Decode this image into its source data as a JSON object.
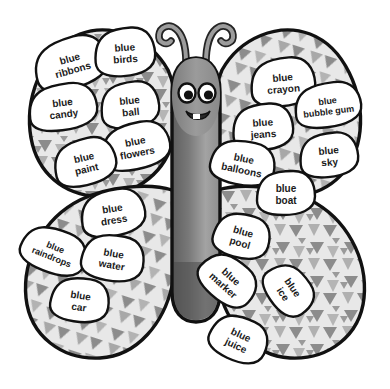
{
  "image": {
    "title": "Blue Words Butterfly",
    "subject": "butterfly-worksheet",
    "background_color": "#ffffff"
  },
  "colors": {
    "outline": "#111111",
    "wing_base": "#e8e8e8",
    "wing_triangle": "#8c8c8c",
    "wing_triangle_light": "#b5b5b5",
    "body_dark": "#6e6e6e",
    "body_light": "#a9a9a9",
    "antenna": "#8a8a8a",
    "eye_white": "#ffffff",
    "eye_pupil": "#111111",
    "mouth": "#2a2a2a",
    "tooth": "#ffffff",
    "label_fill": "#ffffff",
    "label_text": "#1a1a1a"
  },
  "body": {
    "name": "butterfly-body",
    "face": {
      "left_eye": "left-eye",
      "right_eye": "right-eye",
      "mouth": "smiling-mouth",
      "tooth": "tooth"
    },
    "antennae": [
      "left-antenna",
      "right-antenna"
    ]
  },
  "wings": [
    {
      "id": "upper-left",
      "label": "Upper Left Wing"
    },
    {
      "id": "upper-right",
      "label": "Upper Right Wing"
    },
    {
      "id": "lower-left",
      "label": "Lower Left Wing"
    },
    {
      "id": "lower-right",
      "label": "Lower Right Wing"
    }
  ],
  "word_labels": [
    {
      "id": "blue-ribbons",
      "line1": "blue",
      "line2": "ribbons",
      "wing": "upper-left",
      "x": 71,
      "y": 63,
      "rot": -16,
      "rx": 37,
      "ry": 25,
      "fs": 10
    },
    {
      "id": "blue-birds",
      "line1": "blue",
      "line2": "birds",
      "wing": "upper-left",
      "x": 125,
      "y": 52,
      "rot": -4,
      "rx": 30,
      "ry": 24,
      "fs": 10
    },
    {
      "id": "blue-candy",
      "line1": "blue",
      "line2": "candy",
      "wing": "upper-left",
      "x": 63,
      "y": 107,
      "rot": -7,
      "rx": 34,
      "ry": 23,
      "fs": 10
    },
    {
      "id": "blue-ball",
      "line1": "blue",
      "line2": "ball",
      "wing": "upper-left",
      "x": 130,
      "y": 105,
      "rot": -6,
      "rx": 29,
      "ry": 23,
      "fs": 10
    },
    {
      "id": "blue-flowers",
      "line1": "blue",
      "line2": "flowers",
      "wing": "upper-left",
      "x": 136,
      "y": 146,
      "rot": -11,
      "rx": 34,
      "ry": 23,
      "fs": 10
    },
    {
      "id": "blue-paint",
      "line1": "blue",
      "line2": "paint",
      "wing": "upper-left",
      "x": 85,
      "y": 162,
      "rot": -13,
      "rx": 31,
      "ry": 23,
      "fs": 10
    },
    {
      "id": "blue-crayon",
      "line1": "blue",
      "line2": "crayon",
      "wing": "upper-right",
      "x": 283,
      "y": 82,
      "rot": -5,
      "rx": 32,
      "ry": 24,
      "fs": 10
    },
    {
      "id": "blue-bubble-gum",
      "line1": "blue",
      "line2": "bubble gum",
      "wing": "upper-right",
      "x": 328,
      "y": 105,
      "rot": -7,
      "rx": 33,
      "ry": 22,
      "fs": 9
    },
    {
      "id": "blue-jeans",
      "line1": "blue",
      "line2": "jeans",
      "wing": "upper-right",
      "x": 263,
      "y": 127,
      "rot": -4,
      "rx": 30,
      "ry": 23,
      "fs": 10
    },
    {
      "id": "blue-sky",
      "line1": "blue",
      "line2": "sky",
      "wing": "upper-right",
      "x": 329,
      "y": 155,
      "rot": -5,
      "rx": 29,
      "ry": 22,
      "fs": 10
    },
    {
      "id": "blue-balloons",
      "line1": "blue",
      "line2": "balloons",
      "wing": "upper-right",
      "x": 243,
      "y": 163,
      "rot": 12,
      "rx": 32,
      "ry": 22,
      "fs": 10
    },
    {
      "id": "blue-boat",
      "line1": "blue",
      "line2": "boat",
      "wing": "upper-right",
      "x": 286,
      "y": 193,
      "rot": 0,
      "rx": 29,
      "ry": 22,
      "fs": 10
    },
    {
      "id": "blue-dress",
      "line1": "blue",
      "line2": "dress",
      "wing": "lower-left",
      "x": 113,
      "y": 213,
      "rot": -9,
      "rx": 32,
      "ry": 23,
      "fs": 10
    },
    {
      "id": "blue-raindrops",
      "line1": "blue",
      "line2": "raindrops",
      "wing": "lower-left",
      "x": 54,
      "y": 251,
      "rot": 22,
      "rx": 33,
      "ry": 22,
      "fs": 9
    },
    {
      "id": "blue-water",
      "line1": "blue",
      "line2": "water",
      "wing": "lower-left",
      "x": 113,
      "y": 258,
      "rot": 10,
      "rx": 31,
      "ry": 23,
      "fs": 10
    },
    {
      "id": "blue-car",
      "line1": "blue",
      "line2": "car",
      "wing": "lower-left",
      "x": 80,
      "y": 300,
      "rot": 9,
      "rx": 29,
      "ry": 22,
      "fs": 10
    },
    {
      "id": "blue-pool",
      "line1": "blue",
      "line2": "pool",
      "wing": "lower-right",
      "x": 242,
      "y": 236,
      "rot": 16,
      "rx": 28,
      "ry": 22,
      "fs": 10
    },
    {
      "id": "blue-marker",
      "line1": "blue",
      "line2": "marker",
      "wing": "lower-right",
      "x": 228,
      "y": 280,
      "rot": 42,
      "rx": 30,
      "ry": 22,
      "fs": 10
    },
    {
      "id": "blue-ice",
      "line1": "blue",
      "line2": "ice",
      "wing": "lower-right",
      "x": 289,
      "y": 290,
      "rot": 56,
      "rx": 27,
      "ry": 21,
      "fs": 10
    },
    {
      "id": "blue-juice",
      "line1": "blue",
      "line2": "juice",
      "wing": "lower-right",
      "x": 239,
      "y": 339,
      "rot": 25,
      "rx": 29,
      "ry": 22,
      "fs": 10
    }
  ]
}
